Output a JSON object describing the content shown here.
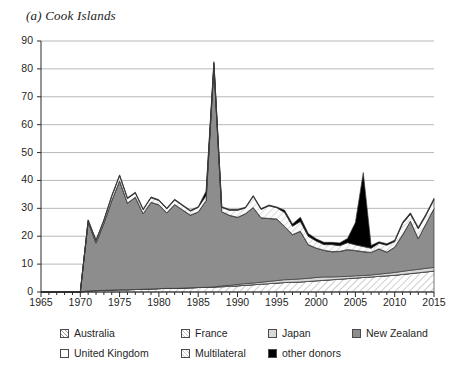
{
  "title": "(a) Cook Islands",
  "legend": {
    "row1": [
      {
        "label": "Australia",
        "key": "australia"
      },
      {
        "label": "France",
        "key": "france"
      },
      {
        "label": "Japan",
        "key": "japan"
      },
      {
        "label": "New Zealand",
        "key": "new_zealand"
      }
    ],
    "row2": [
      {
        "label": "United Kingdom",
        "key": "united_kingdom"
      },
      {
        "label": "Multilateral",
        "key": "multilateral"
      },
      {
        "label": "other donors",
        "key": "other_donors"
      }
    ]
  },
  "colors": {
    "australia": "#ffffff",
    "france": "#ffffff",
    "japan": "#d9d9d9",
    "new_zealand": "#8d8d8d",
    "united_kingdom": "#ffffff",
    "multilateral": "#f2f2f2",
    "other_donors": "#000000",
    "gridline": "#b9b9b9",
    "axis": "#2a2a2a",
    "outline": "#3a3a3a"
  },
  "chart_data": {
    "type": "area",
    "stacked": true,
    "title": "(a) Cook Islands",
    "xlabel": "",
    "ylabel": "",
    "xlim": [
      1965,
      2015
    ],
    "ylim": [
      0,
      90
    ],
    "ytick_step": 10,
    "xtick_step": 5,
    "yticks": [
      0,
      10,
      20,
      30,
      40,
      50,
      60,
      70,
      80,
      90
    ],
    "xticks": [
      1965,
      1970,
      1975,
      1980,
      1985,
      1990,
      1995,
      2000,
      2005,
      2010,
      2015
    ],
    "grid": "horizontal",
    "legend_position": "below",
    "x": [
      1965,
      1966,
      1967,
      1968,
      1969,
      1970,
      1971,
      1972,
      1973,
      1974,
      1975,
      1976,
      1977,
      1978,
      1979,
      1980,
      1981,
      1982,
      1983,
      1984,
      1985,
      1986,
      1987,
      1988,
      1989,
      1990,
      1991,
      1992,
      1993,
      1994,
      1995,
      1996,
      1997,
      1998,
      1999,
      2000,
      2001,
      2002,
      2003,
      2004,
      2005,
      2006,
      2007,
      2008,
      2009,
      2010,
      2011,
      2012,
      2013,
      2014,
      2015
    ],
    "series": [
      {
        "name": "Australia",
        "key": "australia",
        "pattern": "diagonal-hatch-right",
        "values": [
          0,
          0,
          0,
          0,
          0,
          0,
          0.4,
          0.5,
          0.6,
          0.7,
          0.8,
          0.8,
          0.9,
          1.0,
          1.1,
          1.2,
          1.3,
          1.3,
          1.4,
          1.5,
          1.6,
          1.7,
          1.8,
          1.9,
          2.0,
          2.2,
          2.4,
          2.6,
          2.8,
          3.0,
          3.2,
          3.4,
          3.5,
          3.6,
          3.8,
          4.0,
          4.2,
          4.4,
          4.6,
          4.8,
          5.0,
          5.2,
          5.4,
          5.6,
          5.8,
          6.0,
          6.3,
          6.6,
          6.9,
          7.2,
          7.5
        ]
      },
      {
        "name": "France",
        "key": "france",
        "pattern": "dotted-light",
        "values": [
          0,
          0,
          0,
          0,
          0,
          0,
          0,
          0,
          0,
          0,
          0,
          0,
          0,
          0,
          0,
          0,
          0,
          0,
          0,
          0,
          0,
          0,
          0,
          0,
          0,
          0,
          0,
          0,
          0,
          0,
          0,
          0,
          0,
          0,
          0,
          0,
          0,
          0,
          0,
          0,
          0,
          0,
          0,
          0,
          0,
          0,
          0,
          0,
          0,
          0,
          0
        ]
      },
      {
        "name": "Japan",
        "key": "japan",
        "pattern": "solid-light-gray",
        "values": [
          0,
          0,
          0,
          0,
          0,
          0,
          0,
          0,
          0,
          0,
          0,
          0,
          0,
          0,
          0,
          0,
          0,
          0,
          0,
          0,
          0,
          0,
          0,
          0.3,
          0.4,
          0.5,
          0.6,
          0.6,
          0.7,
          0.8,
          0.9,
          1.0,
          1.0,
          1.1,
          1.1,
          1.2,
          1.2,
          1.0,
          0.9,
          0.8,
          0.8,
          0.7,
          0.7,
          0.8,
          0.9,
          1.0,
          1.1,
          1.2,
          1.2,
          1.3,
          1.3
        ]
      },
      {
        "name": "New Zealand",
        "key": "new_zealand",
        "pattern": "solid-mid-gray",
        "values": [
          0,
          0,
          0,
          0,
          0,
          0,
          24.6,
          17.0,
          24.0,
          32.0,
          39.0,
          31.0,
          33.0,
          27.0,
          31.0,
          30.0,
          27.0,
          30.0,
          28.0,
          26.0,
          27.0,
          31.0,
          79.0,
          26.5,
          25.0,
          24.0,
          25.0,
          27.0,
          23.0,
          22.5,
          22.0,
          19.0,
          16.0,
          17.0,
          12.0,
          10.5,
          9.5,
          9.0,
          9.0,
          9.5,
          9.0,
          8.5,
          8.0,
          9.0,
          7.5,
          9.0,
          13.0,
          17.5,
          11.0,
          16.0,
          21.0
        ]
      },
      {
        "name": "United Kingdom",
        "key": "united_kingdom",
        "pattern": "white-outline",
        "values": [
          0,
          0,
          0,
          0,
          0,
          0,
          0.1,
          0.1,
          0.1,
          0.1,
          0.1,
          0.1,
          0.1,
          0.1,
          0.1,
          0.1,
          0.1,
          0.1,
          0.1,
          0.1,
          0.1,
          0.1,
          0.1,
          0.1,
          0.1,
          0.1,
          0.1,
          0.1,
          0.1,
          0.1,
          0.1,
          0.1,
          0.1,
          0.1,
          0.1,
          0.1,
          0.1,
          0.1,
          0.1,
          0.1,
          0.1,
          0.1,
          0.1,
          0.1,
          0.1,
          0.1,
          0.1,
          0.1,
          0.1,
          0.1,
          0.1
        ]
      },
      {
        "name": "Multilateral",
        "key": "multilateral",
        "pattern": "diagonal-hatch-light",
        "values": [
          0,
          0,
          0,
          0,
          0,
          0,
          0.6,
          0.8,
          1.0,
          1.5,
          1.8,
          1.6,
          1.5,
          1.4,
          1.6,
          1.5,
          1.4,
          1.6,
          1.5,
          1.4,
          1.6,
          1.8,
          1.2,
          1.5,
          1.8,
          2.5,
          2.0,
          4.0,
          3.0,
          4.5,
          4.0,
          5.0,
          3.0,
          3.5,
          3.0,
          2.5,
          2.0,
          2.5,
          2.0,
          2.5,
          2.0,
          1.8,
          1.5,
          2.0,
          2.5,
          2.0,
          4.0,
          2.5,
          3.5,
          3.0,
          3.2
        ]
      },
      {
        "name": "other donors",
        "key": "other_donors",
        "pattern": "solid-black",
        "values": [
          0,
          0,
          0,
          0,
          0,
          0,
          0.2,
          0.2,
          0.2,
          0.3,
          0.3,
          0.3,
          0.3,
          0.3,
          0.3,
          0.3,
          0.3,
          0.3,
          0.3,
          0.3,
          0.3,
          1.5,
          0.5,
          0.3,
          0.3,
          0.3,
          0.3,
          0.3,
          0.3,
          0.3,
          0.3,
          0.8,
          0.8,
          1.5,
          1.0,
          0.8,
          0.8,
          0.8,
          1.0,
          1.5,
          8.0,
          26.5,
          1.0,
          0.5,
          0.5,
          0.5,
          0.5,
          0.5,
          0.5,
          0.5,
          0.5
        ]
      }
    ]
  }
}
